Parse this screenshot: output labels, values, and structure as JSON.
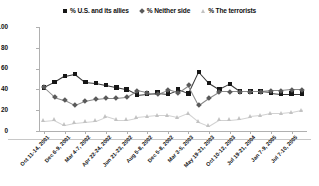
{
  "legend": {
    "position": "top-center",
    "items": [
      {
        "label": "% U.S. and its allies",
        "marker": "square-marker",
        "color": "#161616"
      },
      {
        "label": "% Neither side",
        "marker": "diamond-marker",
        "color": "#5a5a5a"
      },
      {
        "label": "% The terrorists",
        "marker": "triangle-marker",
        "color": "#c2c2c2"
      }
    ]
  },
  "chart_data": {
    "type": "line",
    "title": "",
    "subtitle": "",
    "xlabel": "",
    "ylabel": "",
    "ylim": [
      0,
      100
    ],
    "yticks": [
      0,
      20,
      40,
      60,
      80,
      100
    ],
    "grid": false,
    "legend_position": "top-center",
    "x": [
      "Oct 11-14, 2001",
      "Nov 8-11, 2001",
      "Dec 6-9, 2001",
      "Jan 11-14, 2002",
      "Mar 4-7, 2002",
      "Apr 5-7, 2002",
      "Apr 22-24, 2002",
      "May 28-29, 2002",
      "Jun 21-23, 2002",
      "Jul 26-28, 2002",
      "Aug 5-8, 2002",
      "Oct 3-6, 2002",
      "Dec 5-8, 2002",
      "Jan 23-25, 2003",
      "Mar 3-5, 2003",
      "Apr 14-16, 2003",
      "May 19-21, 2003",
      "Aug 4-6, 2003",
      "Oct 10-12, 2003",
      "Feb 6-8, 2004",
      "Jul 19-21, 2004",
      "Oct 1-3, 2004",
      "Jan 7-9, 2005",
      "Apr 1-3, 2005",
      "Jul 7-10, 2005",
      "Oct 13-16, 2005"
    ],
    "xtick_labels": [
      "Oct 11-14, 2001",
      "Dec 6-9, 2001",
      "Mar 4-7, 2002",
      "Apr 22-24, 2002",
      "Jun 21-23, 2002",
      "Aug 5-8, 2002",
      "Dec 5-8, 2002",
      "Mar 3-5, 2003",
      "May 19-21, 2003",
      "Oct 10-12, 2003",
      "Jul 19-21, 2004",
      "Jan 7-9, 2005",
      "Jul 7-10, 2005"
    ],
    "xtick_indices": [
      0,
      2,
      4,
      6,
      8,
      10,
      12,
      14,
      16,
      18,
      20,
      22,
      24
    ],
    "series": [
      {
        "name": "% U.S. and its allies",
        "marker": "square",
        "color": "#161616",
        "values": [
          42,
          47,
          53,
          55,
          47,
          46,
          44,
          42,
          40,
          35,
          36,
          37,
          36,
          40,
          36,
          57,
          46,
          40,
          45,
          38,
          38,
          38,
          37,
          36,
          36,
          36
        ]
      },
      {
        "name": "% Neither side",
        "marker": "diamond",
        "color": "#5a5a5a",
        "values": [
          42,
          33,
          30,
          25,
          29,
          31,
          32,
          32,
          33,
          39,
          37,
          36,
          40,
          37,
          44,
          25,
          32,
          38,
          38,
          38,
          38,
          38,
          39,
          39,
          40,
          40
        ]
      },
      {
        "name": "% The terrorists",
        "marker": "triangle",
        "color": "#c2c2c2",
        "values": [
          10,
          11,
          6,
          8,
          9,
          10,
          14,
          11,
          11,
          13,
          14,
          15,
          15,
          13,
          17,
          9,
          5,
          11,
          11,
          12,
          14,
          15,
          17,
          17,
          18,
          20
        ]
      }
    ]
  }
}
